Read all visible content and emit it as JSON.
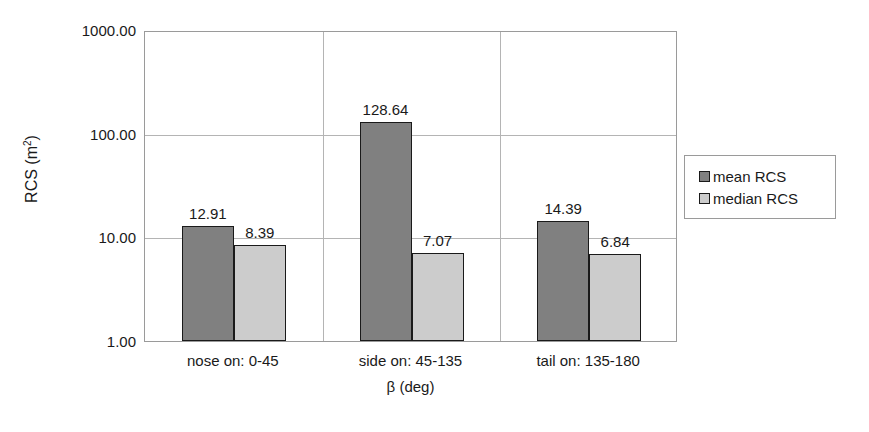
{
  "chart_data": {
    "type": "bar",
    "title": "",
    "xlabel": "β (deg)",
    "ylabel": "RCS (m²)",
    "ylabel_base": "RCS (m",
    "ylabel_sup": "2",
    "ylabel_close": ")",
    "yscale": "log",
    "ylim": [
      1,
      1000
    ],
    "ytick_labels": [
      "1000.00",
      "100.00",
      "10.00",
      "1.00"
    ],
    "ytick_values": [
      1000,
      100,
      10,
      1
    ],
    "grid": true,
    "legend_position": "right",
    "categories": [
      "nose on:  0-45",
      "side on: 45-135",
      "tail on: 135-180"
    ],
    "series": [
      {
        "name": "mean RCS",
        "color": "#808080",
        "values": [
          12.91,
          128.64,
          14.39
        ],
        "labels": [
          "12.91",
          "128.64",
          "14.39"
        ]
      },
      {
        "name": "median RCS",
        "color": "#cccccc",
        "values": [
          8.39,
          7.07,
          6.84
        ],
        "labels": [
          "8.39",
          "7.07",
          "6.84"
        ]
      }
    ]
  },
  "legend": {
    "entries": [
      {
        "label": "mean RCS",
        "color": "#808080"
      },
      {
        "label": "median RCS",
        "color": "#cccccc"
      }
    ]
  },
  "colors": {
    "mean": "#808080",
    "median": "#cccccc",
    "grid": "#b4b4b4",
    "axis": "#9a9a9a",
    "text": "#1a1a1a",
    "background": "#ffffff"
  }
}
